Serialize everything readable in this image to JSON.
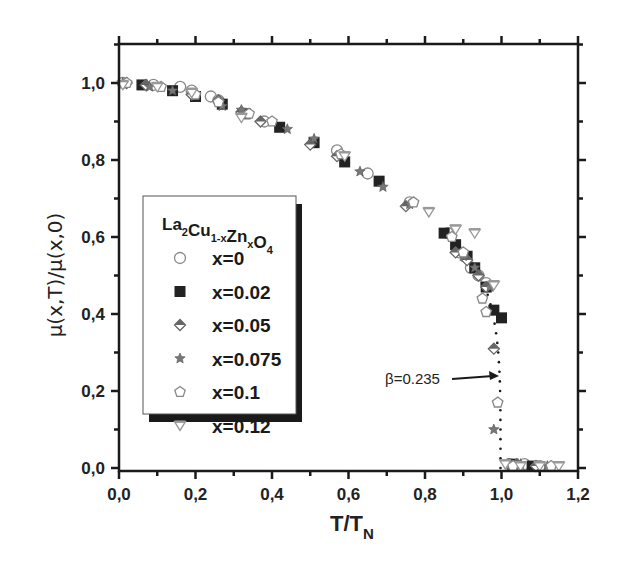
{
  "chart_data": {
    "type": "scatter",
    "title": "",
    "xlabel": "T/T_N",
    "xlabel_main": "T/T",
    "xlabel_sub": "N",
    "ylabel": "μ(x,T)/μ(x,0)",
    "xlim": [
      0.0,
      1.2
    ],
    "ylim": [
      -0.01,
      1.1
    ],
    "grid": false,
    "x_ticks": [
      "0,0",
      "0,2",
      "0,4",
      "0,6",
      "0,8",
      "1,0",
      "1,2"
    ],
    "x_tick_values": [
      0.0,
      0.2,
      0.4,
      0.6,
      0.8,
      1.0,
      1.2
    ],
    "y_ticks": [
      "0,0",
      "0,2",
      "0,4",
      "0,6",
      "0,8",
      "1,0"
    ],
    "y_tick_values": [
      0.0,
      0.2,
      0.4,
      0.6,
      0.8,
      1.0
    ],
    "legend": {
      "position": "center-left",
      "title": "La2Cu1-xZnxO4",
      "title_parts": [
        {
          "t": "La",
          "sub": "2"
        },
        {
          "t": "Cu",
          "sub": "1-x"
        },
        {
          "t": "Zn",
          "sub": "x"
        },
        {
          "t": "O",
          "sub": "4"
        }
      ]
    },
    "annotations": [
      {
        "text": "β=0.235",
        "x": 0.78,
        "y": 0.22,
        "arrow_to": [
          0.995,
          0.23
        ]
      }
    ],
    "fit_line": {
      "style": "dotted",
      "description": "critical power-law fit with β=0.235",
      "x_end": 1.0
    },
    "series": [
      {
        "name": "x=0",
        "marker": "circle-open",
        "color": "#888888",
        "points": [
          [
            0.01,
            1.0
          ],
          [
            0.09,
            0.995
          ],
          [
            0.16,
            0.99
          ],
          [
            0.19,
            0.98
          ],
          [
            0.24,
            0.965
          ],
          [
            0.26,
            0.955
          ],
          [
            0.38,
            0.9
          ],
          [
            0.57,
            0.825
          ],
          [
            0.65,
            0.765
          ],
          [
            0.76,
            0.69
          ],
          [
            0.86,
            0.61
          ],
          [
            0.89,
            0.56
          ],
          [
            0.92,
            0.52
          ],
          [
            0.94,
            0.5
          ],
          [
            0.96,
            0.48
          ],
          [
            1.02,
            0.01
          ],
          [
            1.06,
            0.01
          ],
          [
            1.1,
            0.005
          ]
        ]
      },
      {
        "name": "x=0.02",
        "marker": "square-filled",
        "color": "#222222",
        "points": [
          [
            0.06,
            0.995
          ],
          [
            0.14,
            0.98
          ],
          [
            0.2,
            0.965
          ],
          [
            0.27,
            0.945
          ],
          [
            0.33,
            0.92
          ],
          [
            0.42,
            0.885
          ],
          [
            0.51,
            0.845
          ],
          [
            0.59,
            0.795
          ],
          [
            0.68,
            0.745
          ],
          [
            0.85,
            0.61
          ],
          [
            0.88,
            0.58
          ],
          [
            0.91,
            0.55
          ],
          [
            0.93,
            0.52
          ],
          [
            0.96,
            0.47
          ],
          [
            0.98,
            0.41
          ],
          [
            1.0,
            0.39
          ],
          [
            1.03,
            0.01
          ],
          [
            1.08,
            0.005
          ]
        ]
      },
      {
        "name": "x=0.05",
        "marker": "diamond-half",
        "color": "#666666",
        "points": [
          [
            0.02,
            1.0
          ],
          [
            0.07,
            0.995
          ],
          [
            0.19,
            0.97
          ],
          [
            0.26,
            0.955
          ],
          [
            0.32,
            0.925
          ],
          [
            0.37,
            0.9
          ],
          [
            0.5,
            0.84
          ],
          [
            0.57,
            0.81
          ],
          [
            0.75,
            0.68
          ],
          [
            0.88,
            0.56
          ],
          [
            0.91,
            0.54
          ],
          [
            0.94,
            0.5
          ],
          [
            0.96,
            0.47
          ],
          [
            0.98,
            0.31
          ],
          [
            1.04,
            0.01
          ],
          [
            1.09,
            0.005
          ]
        ]
      },
      {
        "name": "x=0.075",
        "marker": "star",
        "color": "#777777",
        "points": [
          [
            0.01,
            1.0
          ],
          [
            0.08,
            0.99
          ],
          [
            0.14,
            0.98
          ],
          [
            0.27,
            0.94
          ],
          [
            0.32,
            0.93
          ],
          [
            0.44,
            0.88
          ],
          [
            0.51,
            0.855
          ],
          [
            0.63,
            0.77
          ],
          [
            0.69,
            0.73
          ],
          [
            0.76,
            0.685
          ],
          [
            0.9,
            0.55
          ],
          [
            0.93,
            0.52
          ],
          [
            0.97,
            0.47
          ],
          [
            0.98,
            0.1
          ],
          [
            1.05,
            0.01
          ],
          [
            1.12,
            0.005
          ]
        ]
      },
      {
        "name": "x=0.1",
        "marker": "pentagon-open",
        "color": "#888888",
        "points": [
          [
            0.02,
            1.0
          ],
          [
            0.11,
            0.99
          ],
          [
            0.2,
            0.97
          ],
          [
            0.26,
            0.95
          ],
          [
            0.34,
            0.92
          ],
          [
            0.4,
            0.9
          ],
          [
            0.58,
            0.815
          ],
          [
            0.77,
            0.69
          ],
          [
            0.87,
            0.6
          ],
          [
            0.9,
            0.56
          ],
          [
            0.95,
            0.44
          ],
          [
            0.96,
            0.405
          ],
          [
            0.99,
            0.17
          ],
          [
            1.03,
            0.005
          ],
          [
            1.13,
            0.005
          ]
        ]
      },
      {
        "name": "x=0.12",
        "marker": "triangle-down-open",
        "color": "#999999",
        "points": [
          [
            0.01,
            0.995
          ],
          [
            0.1,
            0.99
          ],
          [
            0.19,
            0.975
          ],
          [
            0.32,
            0.91
          ],
          [
            0.59,
            0.81
          ],
          [
            0.81,
            0.665
          ],
          [
            0.88,
            0.62
          ],
          [
            0.93,
            0.61
          ],
          [
            0.98,
            0.475
          ],
          [
            1.01,
            0.01
          ],
          [
            1.05,
            0.005
          ],
          [
            1.1,
            0.005
          ],
          [
            1.15,
            0.005
          ]
        ]
      }
    ]
  }
}
